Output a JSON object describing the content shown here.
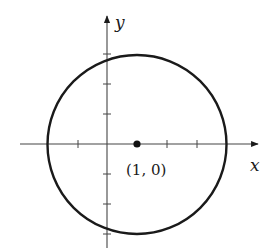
{
  "diagram": {
    "type": "circle-on-axes",
    "axes": {
      "x_label": "x",
      "y_label": "y",
      "x_ticks": [
        -1,
        1,
        2,
        3
      ],
      "y_ticks": [
        -3,
        -2,
        -1,
        1,
        2,
        3
      ]
    },
    "circle": {
      "center": [
        1,
        0
      ],
      "radius": 3
    },
    "point": {
      "label": "(1, 0)",
      "coords": [
        1,
        0
      ]
    },
    "colors": {
      "stroke": "#1a1a1a",
      "axis": "#444444",
      "background": "#ffffff"
    }
  }
}
